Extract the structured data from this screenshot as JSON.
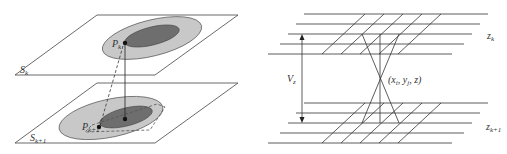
{
  "figure_left": {
    "planes": [
      {
        "label": "S",
        "subscript": "k"
      },
      {
        "label": "S",
        "subscript": "k+1"
      }
    ],
    "points": [
      {
        "label": "P",
        "subscript": "k"
      },
      {
        "label": "P",
        "subscript": "k+1"
      }
    ],
    "colors": {
      "outer_region": "#c8c8c8",
      "inner_region": "#6e6e6e",
      "lines": "#333333"
    }
  },
  "figure_right": {
    "layers": [
      {
        "label": "z",
        "subscript": "k"
      },
      {
        "label": "z",
        "subscript": "k+1"
      }
    ],
    "dimension_label": {
      "label": "V",
      "subscript": "z"
    },
    "intersection_label": "(x",
    "intersection_parts": {
      "x_sub": "i",
      "sep1": ", y",
      "y_sub": "j",
      "tail": ", z)"
    }
  }
}
